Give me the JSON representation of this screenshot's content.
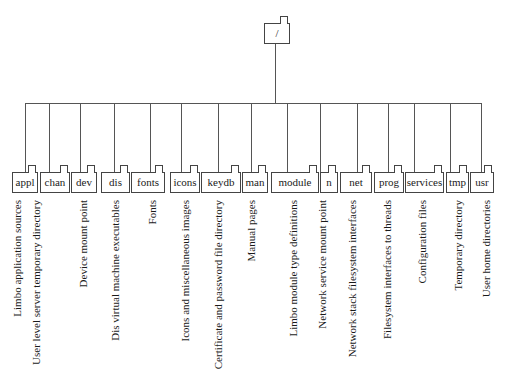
{
  "diagram": {
    "type": "directory-tree",
    "root": {
      "label": "/",
      "x": 264,
      "width": 26,
      "drop_x": 275
    },
    "bus": {
      "y": 103,
      "x_start": 25,
      "x_end": 482
    },
    "children": [
      {
        "label": "appl",
        "description": "Limbo application sources",
        "x": 12,
        "width": 26,
        "drop_x": 25,
        "label_x": 10
      },
      {
        "label": "chan",
        "description": "User level server temporary directory",
        "x": 40,
        "width": 30,
        "drop_x": 49,
        "label_x": 29
      },
      {
        "label": "dev",
        "description": "Device mount point",
        "x": 71,
        "width": 26,
        "drop_x": 80,
        "label_x": 76
      },
      {
        "label": "dis",
        "description": "Dis virtual machine executables",
        "x": 101,
        "width": 29,
        "drop_x": 114,
        "label_x": 108
      },
      {
        "label": "fonts",
        "description": "Fonts",
        "x": 131,
        "width": 34,
        "drop_x": 150,
        "label_x": 145
      },
      {
        "label": "icons",
        "description": "Icons and miscellaneous images",
        "x": 170,
        "width": 30,
        "drop_x": 181,
        "label_x": 178
      },
      {
        "label": "keydb",
        "description": "Certificate and password file directory",
        "x": 201,
        "width": 40,
        "drop_x": 218,
        "label_x": 211
      },
      {
        "label": "man",
        "description": "Manual pages",
        "x": 242,
        "width": 26,
        "drop_x": 251,
        "label_x": 244
      },
      {
        "label": "module",
        "description": "Limbo module type definitions",
        "x": 271,
        "width": 48,
        "drop_x": 287,
        "label_x": 286
      },
      {
        "label": "n",
        "description": "Network service mount point",
        "x": 320,
        "width": 18,
        "drop_x": 320,
        "label_x": 315
      },
      {
        "label": "net",
        "description": "Network stack filesystem interfaces",
        "x": 340,
        "width": 32,
        "drop_x": 357,
        "label_x": 345
      },
      {
        "label": "prog",
        "description": "Filesystem interfaces to threads",
        "x": 374,
        "width": 30,
        "drop_x": 388,
        "label_x": 380
      },
      {
        "label": "services",
        "description": "Configuration files",
        "x": 405,
        "width": 39,
        "drop_x": 414,
        "label_x": 415
      },
      {
        "label": "tmp",
        "description": "Temporary directory",
        "x": 446,
        "width": 23,
        "drop_x": 450,
        "label_x": 451
      },
      {
        "label": "usr",
        "description": "User home directories",
        "x": 470,
        "width": 24,
        "drop_x": 481,
        "label_x": 479
      }
    ]
  },
  "colors": {
    "line": "#555555",
    "box_border": "#444444",
    "text": "#1a1a1a",
    "background": "#ffffff"
  }
}
